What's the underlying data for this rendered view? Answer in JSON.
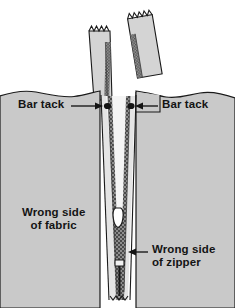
{
  "figure": {
    "labels": {
      "bar_tack_left": "Bar tack",
      "bar_tack_right": "Bar tack",
      "wrong_side_fabric": "Wrong side\nof fabric",
      "wrong_side_zipper": "Wrong side\nof zipper"
    },
    "colors": {
      "background": "#ffffff",
      "fabric": "#c9c9c9",
      "fabric_edge_line": "#1a1a1a",
      "zipper_tape": "#d2d2d2",
      "zipper_tape_upper": "#cfcfcf",
      "zipper_teeth_dark": "#5a5a5a",
      "zipper_teeth_light": "#9a9a9a",
      "seam_gap": "#f2f2f2",
      "slider_fill": "#ffffff",
      "outline": "#1a1a1a",
      "text": "#141414",
      "leader_line": "#1a1a1a"
    },
    "parts": [
      {
        "name": "left-zipper-tape-upper",
        "kind": "tape",
        "note": "free tape end above fabric, zigzag cut top"
      },
      {
        "name": "right-zipper-tape-upper",
        "kind": "tape",
        "note": "tilted free tape end above fabric, zigzag cut top"
      },
      {
        "name": "fabric-panel-left",
        "kind": "fabric",
        "note": "wrong side of fabric, wavy raw top edge"
      },
      {
        "name": "fabric-panel-right",
        "kind": "fabric",
        "note": "wrong side of fabric, wavy raw top edge with folded flap"
      },
      {
        "name": "zipper-teeth-chain",
        "kind": "teeth",
        "note": "closed coil running down the seam"
      },
      {
        "name": "zipper-slider",
        "kind": "slider",
        "note": "pull slider body mid-seam"
      },
      {
        "name": "zipper-bottom-stop",
        "kind": "stop",
        "note": "bottom stop bar"
      },
      {
        "name": "bar-tack-left-dot",
        "kind": "marker"
      },
      {
        "name": "bar-tack-right-dot",
        "kind": "marker"
      },
      {
        "name": "bar-tack-left-leader",
        "kind": "leader-line"
      },
      {
        "name": "bar-tack-right-leader",
        "kind": "leader-line"
      },
      {
        "name": "wrong-side-zipper-leader",
        "kind": "leader-line"
      }
    ]
  }
}
